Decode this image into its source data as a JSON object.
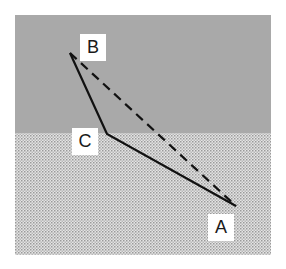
{
  "diagram": {
    "title": "",
    "regions": [
      {
        "name": "upper-region",
        "fill": "#a9a9a9",
        "pattern": "solid"
      },
      {
        "name": "lower-region",
        "fill": "#d2d2d2",
        "pattern": "dotted"
      }
    ],
    "points": [
      {
        "id": "A",
        "label": "A"
      },
      {
        "id": "B",
        "label": "B"
      },
      {
        "id": "C",
        "label": "C"
      }
    ],
    "segments": [
      {
        "from": "B",
        "to": "C",
        "style": "solid"
      },
      {
        "from": "C",
        "to": "A",
        "style": "solid"
      },
      {
        "from": "B",
        "to": "A",
        "style": "dashed"
      }
    ],
    "line_color": "#111111"
  }
}
